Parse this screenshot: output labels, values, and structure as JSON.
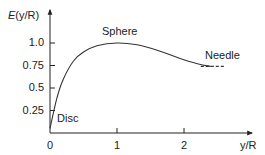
{
  "chart_data": {
    "type": "line",
    "title": "",
    "xlabel": "y/R",
    "ylabel": "E(y/R)",
    "ylabel_parts": {
      "italic": "E",
      "rest": "(y/R)"
    },
    "xlim": [
      0,
      2.9
    ],
    "ylim": [
      0,
      1.1
    ],
    "x_ticks": [
      "0",
      "1",
      "2"
    ],
    "y_ticks": [
      "0.25",
      "0.5",
      "0.75",
      "1.0"
    ],
    "grid": false,
    "series": [
      {
        "name": "E(y/R)",
        "style": "solid",
        "x": [
          0,
          0.1,
          0.2,
          0.35,
          0.5,
          0.7,
          1.0,
          1.3,
          1.6,
          1.9,
          2.2,
          2.4
        ],
        "y": [
          0.05,
          0.38,
          0.6,
          0.8,
          0.9,
          0.97,
          1.0,
          0.98,
          0.92,
          0.84,
          0.77,
          0.74
        ]
      },
      {
        "name": "Needle asymptote",
        "style": "dashed",
        "x": [
          2.25,
          2.6
        ],
        "y": [
          0.74,
          0.74
        ]
      }
    ],
    "annotations": [
      {
        "text": "Disc",
        "x": 0.15,
        "y": 0.12
      },
      {
        "text": "Sphere",
        "x": 1.0,
        "y": 1.05
      },
      {
        "text": "Needle",
        "x": 2.4,
        "y": 0.8
      }
    ]
  }
}
